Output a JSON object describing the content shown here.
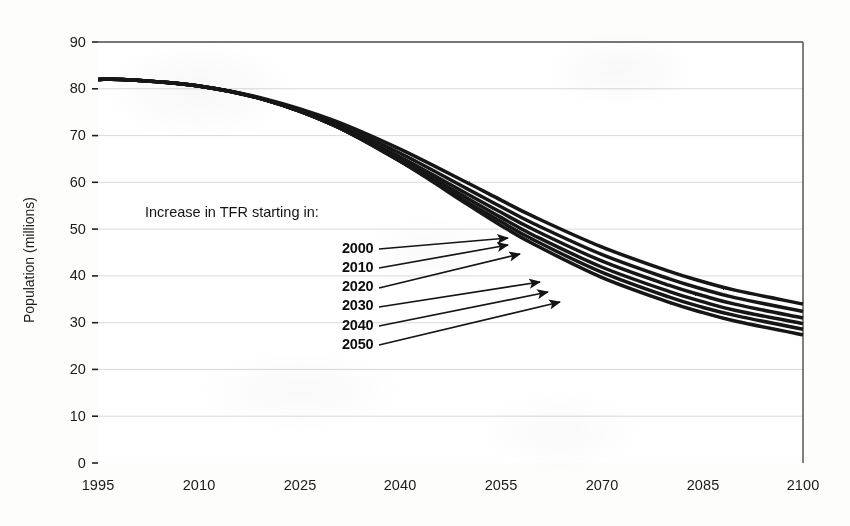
{
  "chart_data": {
    "type": "line",
    "title": "",
    "subtitle": "",
    "xlabel": "",
    "ylabel": "Population (millions)",
    "xlim": [
      1995,
      2100
    ],
    "ylim": [
      0,
      90
    ],
    "xticks": [
      "1995",
      "2010",
      "2025",
      "2040",
      "2055",
      "2070",
      "2085",
      "2100"
    ],
    "yticks": [
      "0",
      "10",
      "20",
      "30",
      "40",
      "50",
      "60",
      "70",
      "80",
      "90"
    ],
    "grid": "horizontal",
    "legend_position": "inside-left",
    "annotation": "Increase in TFR starting in:",
    "x": [
      1995,
      2000,
      2010,
      2020,
      2030,
      2040,
      2050,
      2055,
      2060,
      2070,
      2080,
      2085,
      2090,
      2100
    ],
    "series": [
      {
        "name": "2000",
        "label": "2000",
        "values": [
          82.0,
          81.9,
          80.6,
          77.8,
          73.3,
          67.1,
          59.9,
          56.2,
          52.6,
          46.2,
          41.0,
          38.8,
          36.9,
          34.0
        ]
      },
      {
        "name": "2010",
        "label": "2010",
        "values": [
          82.0,
          81.9,
          80.6,
          77.6,
          72.8,
          66.2,
          58.6,
          54.8,
          51.1,
          44.6,
          39.4,
          37.2,
          35.3,
          32.4
        ]
      },
      {
        "name": "2020",
        "label": "2020",
        "values": [
          82.0,
          81.9,
          80.6,
          77.6,
          72.4,
          65.4,
          57.5,
          53.6,
          49.8,
          43.2,
          38.0,
          35.8,
          33.9,
          31.0
        ]
      },
      {
        "name": "2030",
        "label": "2030",
        "values": [
          82.0,
          81.9,
          80.6,
          77.6,
          72.3,
          64.8,
          56.6,
          52.5,
          48.6,
          41.9,
          36.7,
          34.5,
          32.6,
          29.8
        ]
      },
      {
        "name": "2040",
        "label": "2040",
        "values": [
          82.0,
          81.9,
          80.6,
          77.6,
          72.3,
          64.5,
          55.8,
          51.6,
          47.6,
          40.8,
          35.5,
          33.3,
          31.5,
          28.6
        ]
      },
      {
        "name": "2050",
        "label": "2050",
        "values": [
          82.0,
          81.9,
          80.6,
          77.6,
          72.3,
          64.5,
          55.3,
          50.8,
          46.7,
          39.7,
          34.4,
          32.2,
          30.3,
          27.4
        ]
      }
    ],
    "legend_entries": [
      "2000",
      "2010",
      "2020",
      "2030",
      "2040",
      "2050"
    ],
    "style": {
      "line_color": "#141414",
      "grid_color": "#d6d6d6",
      "axis_color": "#2a2a2a",
      "background": "#ffffff"
    }
  },
  "axis": {
    "y_title": "Population (millions)",
    "x_ticks": [
      {
        "label": "1995"
      },
      {
        "label": "2010"
      },
      {
        "label": "2025"
      },
      {
        "label": "2040"
      },
      {
        "label": "2055"
      },
      {
        "label": "2070"
      },
      {
        "label": "2085"
      },
      {
        "label": "2100"
      }
    ],
    "y_ticks": [
      {
        "label": "90"
      },
      {
        "label": "80"
      },
      {
        "label": "70"
      },
      {
        "label": "60"
      },
      {
        "label": "50"
      },
      {
        "label": "40"
      },
      {
        "label": "30"
      },
      {
        "label": "20"
      },
      {
        "label": "10"
      },
      {
        "label": "0"
      }
    ]
  },
  "annotation": {
    "heading": "Increase in TFR starting in:",
    "labels": [
      {
        "text": "2000"
      },
      {
        "text": "2010"
      },
      {
        "text": "2020"
      },
      {
        "text": "2030"
      },
      {
        "text": "2040"
      },
      {
        "text": "2050"
      }
    ]
  }
}
